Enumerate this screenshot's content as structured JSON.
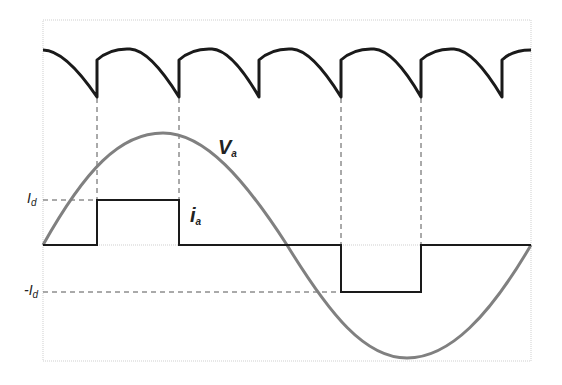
{
  "diagram": {
    "labels": {
      "voltage": {
        "main": "V",
        "sub": "a"
      },
      "current": {
        "main": "i",
        "sub": "a"
      },
      "pos_level": {
        "main": "I",
        "sub": "d"
      },
      "neg_level": {
        "main": "-I",
        "sub": "d"
      }
    },
    "colors": {
      "ripple": "#1a1a1a",
      "sine": "#808080",
      "current": "#1a1a1a",
      "dashed": "#555555",
      "frame": "#c8c8c8"
    },
    "frame": {
      "x0": 43,
      "y0": 20,
      "x1": 531,
      "y1": 361
    },
    "baseline_y": 245,
    "id_y": 200,
    "neg_id_y": 292,
    "commutation_x": [
      97,
      179,
      341,
      421
    ],
    "ripple_cusps_x": [
      97,
      179,
      259,
      341,
      421,
      502
    ]
  }
}
